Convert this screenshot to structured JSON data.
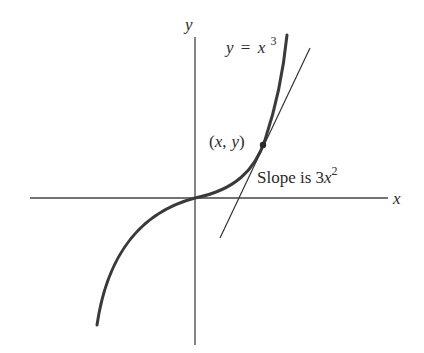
{
  "diagram": {
    "type": "function graph with tangent line",
    "axes": {
      "x_label": "x",
      "y_label": "y"
    },
    "curve": {
      "equation_lhs": "y",
      "equation_eq": "=",
      "equation_base": "x",
      "equation_exp": "3"
    },
    "point": {
      "label": "(x, y)",
      "open": "(",
      "x": "x",
      "comma": ",",
      "y": "y",
      "close": ")"
    },
    "tangent": {
      "prefix": "Slope is 3",
      "var": "x",
      "exp": "2"
    },
    "colors": {
      "ink": "#2a2a2a",
      "curve": "#3a3a3a",
      "background": "#ffffff"
    }
  }
}
